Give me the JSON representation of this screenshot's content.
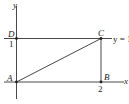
{
  "diagram": {
    "axes": {
      "x_label": "x",
      "y_label": "y"
    },
    "points": {
      "A": "A",
      "B": "B",
      "C": "C",
      "D": "D"
    },
    "ticks": {
      "x_tick": "2",
      "y_tick": "1"
    },
    "line_label": "y = 1",
    "colors": {
      "stroke": "#333333",
      "background": "#ffffff"
    }
  }
}
